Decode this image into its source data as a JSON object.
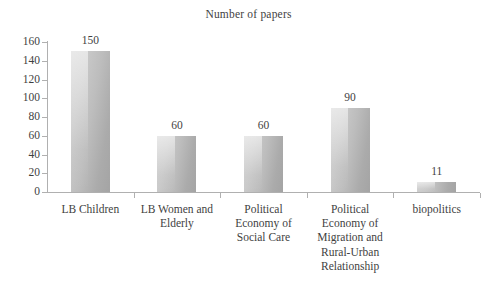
{
  "chart_data": {
    "type": "bar",
    "title": "Number of papers",
    "xlabel": "",
    "ylabel": "",
    "ylim": [
      0,
      160
    ],
    "ytick_step": 20,
    "grid": false,
    "legend": null,
    "categories": [
      "LB Children",
      "LB Women and Elderly",
      "Political Economy of Social Care",
      "Political Economy of Migration and Rural-Urban Relationship",
      "biopolitics"
    ],
    "category_lines": [
      [
        "LB Children"
      ],
      [
        "LB Women and",
        "Elderly"
      ],
      [
        "Political",
        "Economy of",
        "Social Care"
      ],
      [
        "Political",
        "Economy of",
        "Migration and",
        "Rural-Urban",
        "Relationship"
      ],
      [
        "biopolitics"
      ]
    ],
    "values": [
      150,
      60,
      60,
      90,
      11
    ],
    "value_labels": [
      "150",
      "60",
      "60",
      "90",
      "11"
    ],
    "ytick_labels": [
      "160",
      "140",
      "120",
      "100",
      "80",
      "60",
      "40",
      "20",
      "0"
    ],
    "ytick_values": [
      160,
      140,
      120,
      100,
      80,
      60,
      40,
      20,
      0
    ],
    "colors": {
      "bar_light": "#cfcfcf",
      "bar_mid": "#bdbdbd",
      "bar_dark": "#a4a4a4",
      "axis": "#b0b0b0",
      "text": "#3f3f3f",
      "background": "#ffffff"
    }
  }
}
